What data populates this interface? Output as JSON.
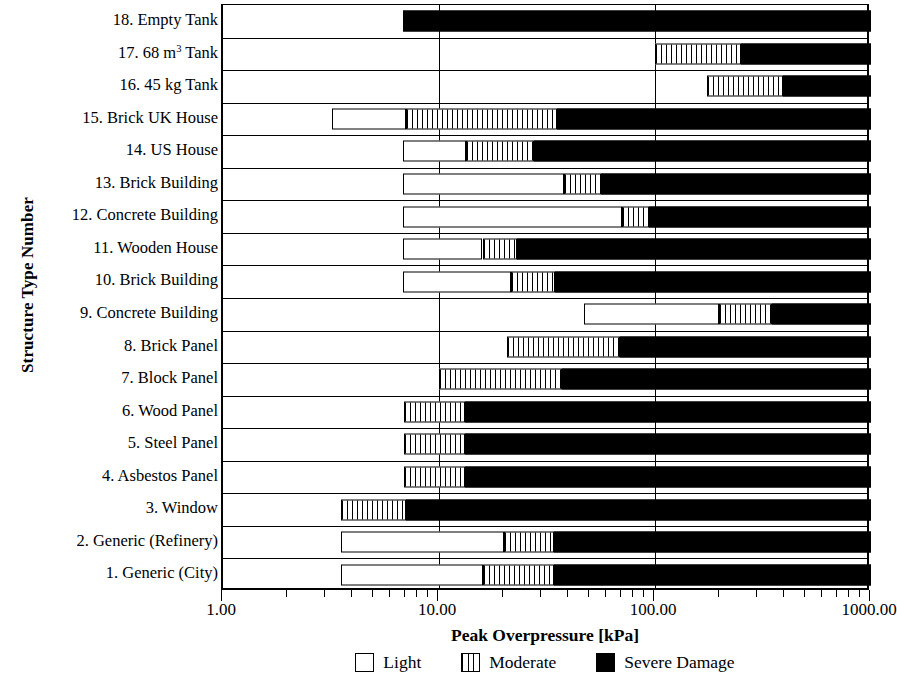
{
  "chart_data": {
    "type": "bar",
    "orientation": "horizontal",
    "stacked": true,
    "title": "",
    "xlabel": "Peak Overpressure [kPa]",
    "ylabel": "Structure Type Number",
    "xscale": "log",
    "xlim": [
      1.0,
      1000.0
    ],
    "xticklabels": [
      "1.00",
      "10.00",
      "100.00",
      "1000.00"
    ],
    "xtickvalues": [
      1.0,
      10.0,
      100.0,
      1000.0
    ],
    "grid": "vertical major + horizontal category separators",
    "legend": {
      "position": "bottom-center",
      "entries": [
        {
          "label": "Light",
          "icon": "open-square-swatch",
          "color": "#ffffff"
        },
        {
          "label": "Moderate",
          "icon": "hatched-square-swatch",
          "color": "#ffffff"
        },
        {
          "label": "Severe Damage",
          "icon": "filled-square-swatch",
          "color": "#000000"
        }
      ]
    },
    "categories": [
      "18. Empty Tank",
      "17. 68 m³ Tank",
      "16. 45 kg Tank",
      "15. Brick UK House",
      "14. US House",
      "13. Brick Building",
      "12. Concrete Building",
      "11. Wooden House",
      "10. Brick Building",
      "9. Concrete Building",
      "8. Brick Panel",
      "7. Block Panel",
      "6. Wood Panel",
      "5. Steel Panel",
      "4. Asbestos Panel",
      "3. Window",
      "2. Generic (Refinery)",
      "1. Generic (City)"
    ],
    "series": [
      {
        "name": "Light",
        "values": [
          null,
          null,
          null,
          3.2,
          6.8,
          6.8,
          6.8,
          6.8,
          6.8,
          47.0,
          null,
          null,
          null,
          null,
          null,
          null,
          3.5,
          3.5
        ]
      },
      {
        "name": "Moderate",
        "values": [
          null,
          100.0,
          175.0,
          7.0,
          13.3,
          38.0,
          70.0,
          15.9,
          21.5,
          198.0,
          20.6,
          10.0,
          6.9,
          6.9,
          6.9,
          4.0,
          20.0,
          16.0
        ]
      },
      {
        "name": "Severe Damage",
        "values": [
          6.8,
          250.0,
          390.0,
          35.0,
          27.5,
          56.5,
          94.0,
          23.0,
          34.5,
          347.0,
          69.0,
          37.0,
          13.2,
          13.2,
          13.2,
          7.0,
          34.0,
          34.0
        ]
      }
    ],
    "bars": [
      {
        "category": "18. Empty Tank",
        "light_start": null,
        "light_end": null,
        "moderate_start": null,
        "moderate_end": null,
        "severe_start": 6.8,
        "severe_end": 1000.0
      },
      {
        "category": "17. 68 m³ Tank",
        "light_start": null,
        "light_end": null,
        "moderate_start": 100.0,
        "moderate_end": 250.0,
        "severe_start": 250.0,
        "severe_end": 1000.0
      },
      {
        "category": "16. 45 kg Tank",
        "light_start": null,
        "light_end": null,
        "moderate_start": 175.0,
        "moderate_end": 390.0,
        "severe_start": 390.0,
        "severe_end": 1000.0
      },
      {
        "category": "15. Brick UK House",
        "light_start": 3.2,
        "light_end": 7.0,
        "moderate_start": 7.0,
        "moderate_end": 35.0,
        "severe_start": 35.0,
        "severe_end": 1000.0
      },
      {
        "category": "14. US House",
        "light_start": 6.8,
        "light_end": 13.3,
        "moderate_start": 13.3,
        "moderate_end": 27.5,
        "severe_start": 27.5,
        "severe_end": 1000.0
      },
      {
        "category": "13. Brick Building",
        "light_start": 6.8,
        "light_end": 38.0,
        "moderate_start": 38.0,
        "moderate_end": 56.5,
        "severe_start": 56.5,
        "severe_end": 1000.0
      },
      {
        "category": "12. Concrete Building",
        "light_start": 6.8,
        "light_end": 70.0,
        "moderate_start": 70.0,
        "moderate_end": 94.0,
        "severe_start": 94.0,
        "severe_end": 1000.0
      },
      {
        "category": "11. Wooden House",
        "light_start": 6.8,
        "light_end": 15.9,
        "moderate_start": 15.9,
        "moderate_end": 23.0,
        "severe_start": 23.0,
        "severe_end": 1000.0
      },
      {
        "category": "10. Brick Building",
        "light_start": 6.8,
        "light_end": 21.5,
        "moderate_start": 21.5,
        "moderate_end": 34.5,
        "severe_start": 34.5,
        "severe_end": 1000.0
      },
      {
        "category": "9. Concrete Building",
        "light_start": 47.0,
        "light_end": 198.0,
        "moderate_start": 198.0,
        "moderate_end": 347.0,
        "severe_start": 347.0,
        "severe_end": 1000.0
      },
      {
        "category": "8. Brick Panel",
        "light_start": null,
        "light_end": null,
        "moderate_start": 20.6,
        "moderate_end": 69.0,
        "severe_start": 69.0,
        "severe_end": 1000.0
      },
      {
        "category": "7. Block Panel",
        "light_start": null,
        "light_end": null,
        "moderate_start": 10.0,
        "moderate_end": 37.0,
        "severe_start": 37.0,
        "severe_end": 1000.0
      },
      {
        "category": "6. Wood Panel",
        "light_start": null,
        "light_end": null,
        "moderate_start": 6.9,
        "moderate_end": 13.2,
        "severe_start": 13.2,
        "severe_end": 1000.0
      },
      {
        "category": "5. Steel Panel",
        "light_start": null,
        "light_end": null,
        "moderate_start": 6.9,
        "moderate_end": 13.2,
        "severe_start": 13.2,
        "severe_end": 1000.0
      },
      {
        "category": "4. Asbestos Panel",
        "light_start": null,
        "light_end": null,
        "moderate_start": 6.9,
        "moderate_end": 13.2,
        "severe_start": 13.2,
        "severe_end": 1000.0
      },
      {
        "category": "3. Window",
        "light_start": null,
        "light_end": null,
        "moderate_start": 3.5,
        "moderate_end": 7.0,
        "severe_start": 7.0,
        "severe_end": 1000.0
      },
      {
        "category": "2. Generic (Refinery)",
        "light_start": 3.5,
        "light_end": 20.0,
        "moderate_start": 20.0,
        "moderate_end": 34.0,
        "severe_start": 34.0,
        "severe_end": 1000.0
      },
      {
        "category": "1. Generic (City)",
        "light_start": 3.5,
        "light_end": 16.0,
        "moderate_start": 16.0,
        "moderate_end": 34.0,
        "severe_start": 34.0,
        "severe_end": 1000.0
      }
    ]
  },
  "axes": {
    "y_title": "Structure Type Number",
    "x_title": "Peak Overpressure [kPa]"
  }
}
